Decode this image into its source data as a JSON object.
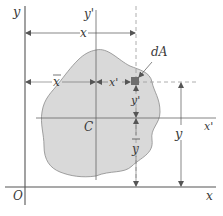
{
  "diagram": {
    "colors": {
      "background": "#ffffff",
      "area_fill": "#d9d9d9",
      "area_stroke": "#8a8a8a",
      "axis": "#555555",
      "dim_line": "#666666",
      "dashed": "#9a9a9a",
      "element": "#6e6e6e",
      "text": "#3a3a3a"
    },
    "labels": {
      "y_axis": "y",
      "y_prime_axis": "y'",
      "x_axis": "x",
      "x_prime_axis": "x'",
      "origin": "O",
      "centroid": "C",
      "element": "dA",
      "dim_x": "x",
      "dim_x_bar": "x",
      "dim_x_prime": "x'",
      "dim_y_prime": "y'",
      "dim_y_bar": "y",
      "dim_y": "y"
    }
  }
}
